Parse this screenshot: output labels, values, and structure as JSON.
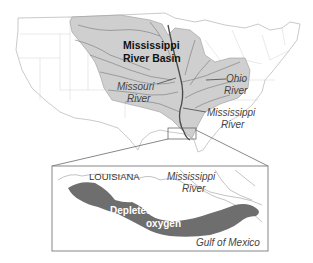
{
  "map": {
    "title": "Mississippi River Basin",
    "colors": {
      "background": "#ffffff",
      "land_outline": "#b9b9b9",
      "basin_fill": "#cfcfcf",
      "rivers": "#6a6a6a",
      "main_river": "#4a4a4a",
      "inset_border": "#7a7a7a",
      "hypoxia_fill": "#6e6e6e",
      "label_dark": "#111111",
      "label_italic": "#444444"
    },
    "labels": {
      "basin_line1": "Mississippi",
      "basin_line2": "River Basin",
      "missouri_line1": "Missouri",
      "missouri_line2": "River",
      "ohio_line1": "Ohio",
      "ohio_line2": "River",
      "mississippi_line1": "Mississippi",
      "mississippi_line2": "River"
    },
    "inset": {
      "state_label": "LOUISIANA",
      "river_line1": "Mississippi",
      "river_line2": "River",
      "zone_line1": "Depleted",
      "zone_line2": "oxygen",
      "gulf_label": "Gulf of Mexico"
    }
  }
}
